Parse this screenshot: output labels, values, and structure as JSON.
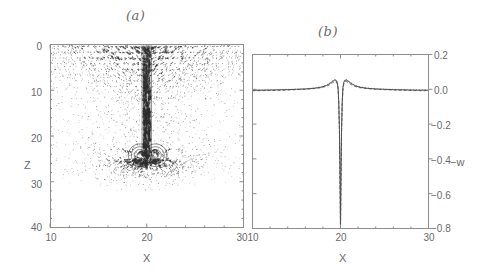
{
  "figure": {
    "panel_a": {
      "title": "(a)",
      "xlabel": "X",
      "ylabel": "Z",
      "x_ticks": [
        "10",
        "20",
        "30"
      ],
      "y_ticks": [
        "0",
        "10",
        "20",
        "30",
        "40"
      ]
    },
    "panel_b": {
      "title": "(b)",
      "xlabel": "X",
      "ylabel": "−w",
      "x_ticks": [
        "10",
        "20",
        "30"
      ],
      "y_ticks": [
        "0.2",
        "0.0",
        "−0.2",
        "−0.4",
        "−0.6",
        "−0.8"
      ]
    }
  },
  "chart_data": [
    {
      "type": "scatter",
      "name": "panel-a-vector-field",
      "title": "(a)",
      "xlabel": "X",
      "ylabel": "Z",
      "xlim": [
        10,
        30
      ],
      "ylim": [
        40,
        0
      ],
      "y_inverted": true,
      "xticks": [
        10,
        20,
        30
      ],
      "yticks": [
        0,
        10,
        20,
        30,
        40
      ],
      "grid": false,
      "description": "Velocity vector field: converging inflow at the surface feeding a narrow vertical downdraft jet at X=20 that penetrates to Z~24 where a pair of counter-rotating vortex rings and radial outflow appear; background filled with small scattered weak vectors.",
      "jet_axis_x": 20,
      "jet_depth_top": 0,
      "jet_depth_bottom": 24,
      "vortex_centers": [
        [
          19.3,
          24.2
        ],
        [
          20.9,
          24.2
        ]
      ],
      "stagnation_point": [
        20,
        26.5
      ]
    },
    {
      "type": "line",
      "name": "panel-b-vertical-velocity-profile",
      "title": "(b)",
      "xlabel": "X",
      "ylabel": "−w",
      "xlim": [
        10,
        30
      ],
      "ylim": [
        -0.8,
        0.2
      ],
      "xticks": [
        10,
        20,
        30
      ],
      "yticks": [
        0.2,
        0.0,
        -0.2,
        -0.4,
        -0.6,
        -0.8
      ],
      "grid": false,
      "legend": null,
      "x": [
        10.0,
        11.0,
        12.0,
        13.0,
        14.0,
        15.0,
        16.0,
        17.0,
        17.8,
        18.4,
        18.8,
        19.1,
        19.35,
        19.5,
        19.62,
        19.72,
        19.8,
        19.88,
        19.95,
        20.0,
        20.05,
        20.12,
        20.2,
        20.28,
        20.38,
        20.5,
        20.65,
        20.9,
        21.2,
        21.6,
        22.2,
        23.0,
        24.0,
        25.0,
        26.0,
        27.0,
        28.0,
        29.0,
        30.0
      ],
      "series": [
        {
          "name": "solid",
          "style": "solid",
          "values": [
            -0.005,
            -0.005,
            -0.004,
            -0.003,
            -0.002,
            0.0,
            0.002,
            0.006,
            0.012,
            0.022,
            0.034,
            0.046,
            0.053,
            0.052,
            0.04,
            0.01,
            -0.07,
            -0.23,
            -0.52,
            -0.79,
            -0.52,
            -0.23,
            -0.07,
            0.01,
            0.04,
            0.052,
            0.053,
            0.046,
            0.034,
            0.022,
            0.012,
            0.006,
            0.002,
            0.0,
            -0.002,
            -0.003,
            -0.004,
            -0.005,
            -0.005
          ]
        },
        {
          "name": "dashed",
          "style": "dashed",
          "values": [
            -0.008,
            -0.008,
            -0.007,
            -0.006,
            -0.004,
            -0.002,
            0.0,
            0.004,
            0.009,
            0.017,
            0.027,
            0.038,
            0.045,
            0.044,
            0.032,
            0.004,
            -0.08,
            -0.25,
            -0.55,
            -0.8,
            -0.55,
            -0.25,
            -0.08,
            0.004,
            0.032,
            0.044,
            0.045,
            0.038,
            0.027,
            0.017,
            0.009,
            0.004,
            0.0,
            -0.002,
            -0.004,
            -0.006,
            -0.007,
            -0.008,
            -0.008
          ]
        },
        {
          "name": "dotted",
          "style": "dotted",
          "values": [
            -0.002,
            -0.002,
            -0.002,
            -0.001,
            0.0,
            0.001,
            0.003,
            0.008,
            0.015,
            0.026,
            0.038,
            0.05,
            0.057,
            0.056,
            0.045,
            0.014,
            -0.06,
            -0.21,
            -0.49,
            -0.77,
            -0.49,
            -0.21,
            -0.06,
            0.014,
            0.045,
            0.056,
            0.057,
            0.05,
            0.038,
            0.026,
            0.015,
            0.008,
            0.003,
            0.001,
            0.0,
            -0.001,
            -0.002,
            -0.002,
            -0.002
          ]
        }
      ]
    }
  ]
}
